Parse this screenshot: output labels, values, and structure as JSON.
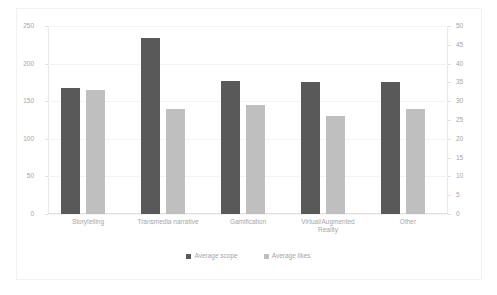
{
  "chart_data": {
    "type": "bar",
    "title": "",
    "xlabel": "",
    "ylabel": "",
    "categories": [
      "Storytelling",
      "Transmedia narrative",
      "Gamification",
      "Virtual/Augmented\nReality",
      "Other"
    ],
    "series": [
      {
        "name": "Average scope",
        "color": "#595959",
        "axis": "left",
        "values": [
          168,
          234,
          177,
          175,
          175
        ]
      },
      {
        "name": "Average likes",
        "color": "#bfbfbf",
        "axis": "right",
        "values": [
          33,
          28,
          29,
          26,
          28
        ]
      }
    ],
    "left_axis": {
      "ticks": [
        0,
        50,
        100,
        150,
        200,
        250
      ],
      "ylim": [
        0,
        250
      ]
    },
    "right_axis": {
      "ticks": [
        0,
        5,
        10,
        15,
        20,
        25,
        30,
        35,
        40,
        45,
        50
      ],
      "ylim": [
        0,
        50
      ]
    },
    "grid": true,
    "legend_position": "bottom"
  },
  "legend": {
    "entries": [
      {
        "label": "Average scope",
        "color": "#595959"
      },
      {
        "label": "Average likes",
        "color": "#bfbfbf"
      }
    ]
  }
}
